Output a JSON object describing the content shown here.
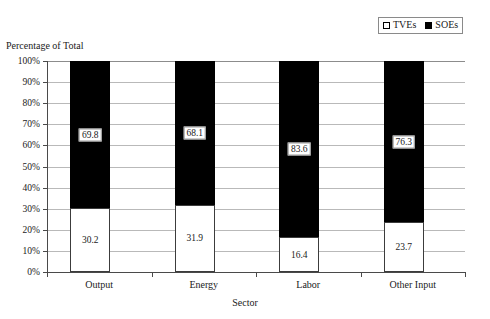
{
  "chart_data": {
    "type": "bar",
    "subtype": "stacked-100-percent",
    "title": "",
    "xlabel": "Sector",
    "ylabel": "Percentage of Total",
    "categories": [
      "Output",
      "Energy",
      "Labor",
      "Other Input"
    ],
    "series": [
      {
        "name": "TVEs",
        "color": "#ffffff",
        "values": [
          30.2,
          31.9,
          16.4,
          23.7
        ]
      },
      {
        "name": "SOEs",
        "color": "#000000",
        "values": [
          69.8,
          68.1,
          83.6,
          76.3
        ]
      }
    ],
    "ylim": [
      0,
      100
    ],
    "ytick_step": 10,
    "ytick_labels": [
      "0%",
      "10%",
      "20%",
      "30%",
      "40%",
      "50%",
      "60%",
      "70%",
      "80%",
      "90%",
      "100%"
    ],
    "grid": true,
    "grid_axis": "y",
    "legend_position": "top-right",
    "value_labels": {
      "tves": [
        "30.2",
        "31.9",
        "16.4",
        "23.7"
      ],
      "soes": [
        "69.8",
        "68.1",
        "83.6",
        "76.3"
      ]
    }
  },
  "legend": {
    "items": [
      {
        "label": "TVEs",
        "swatch": "hollow-square-icon"
      },
      {
        "label": "SOEs",
        "swatch": "filled-square-icon"
      }
    ]
  },
  "axes": {
    "y_title": "Percentage of Total",
    "x_title": "Sector"
  }
}
